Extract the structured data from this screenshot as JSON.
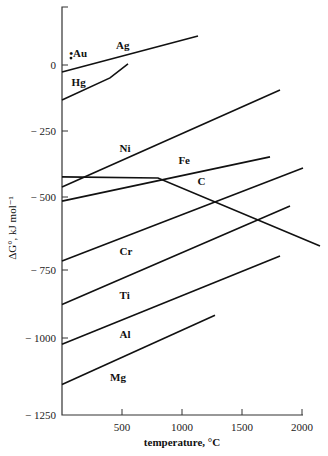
{
  "chart_data": {
    "type": "line",
    "title": "",
    "xlabel": "temperature, °C",
    "ylabel": "ΔG°, kJ mol⁻¹",
    "xlim": [
      0,
      2150
    ],
    "ylim": [
      -1250,
      200
    ],
    "grid": false,
    "legend": "inline labels",
    "x_ticks": [
      500,
      1000,
      1500,
      2000
    ],
    "x_tick_labels": [
      "500",
      "1000",
      "1500",
      "2000"
    ],
    "y_ticks": [
      0,
      -250,
      -500,
      -750,
      -1000,
      -1250
    ],
    "y_tick_labels": [
      "0",
      "− 250",
      "− 500",
      "− 750",
      "− 1000",
      "− 1250"
    ],
    "series": [
      {
        "name": "Ag",
        "points": [
          [
            0,
            -27
          ],
          [
            1133,
            110
          ]
        ]
      },
      {
        "name": "Hg",
        "points": [
          [
            0,
            -133
          ],
          [
            400,
            -49
          ],
          [
            550,
            4
          ]
        ]
      },
      {
        "name": "Ni",
        "points": [
          [
            0,
            -462
          ],
          [
            1817,
            -95
          ]
        ]
      },
      {
        "name": "Fe",
        "points": [
          [
            0,
            -514
          ],
          [
            1733,
            -348
          ]
        ]
      },
      {
        "name": "C",
        "points": [
          [
            0,
            -424
          ],
          [
            800,
            -428
          ],
          [
            2150,
            -668
          ]
        ]
      },
      {
        "name": "Cr",
        "points": [
          [
            0,
            -719
          ],
          [
            2008,
            -390
          ]
        ]
      },
      {
        "name": "Ti",
        "points": [
          [
            0,
            -877
          ],
          [
            1900,
            -531
          ]
        ]
      },
      {
        "name": "Al",
        "points": [
          [
            0,
            -1020
          ],
          [
            1817,
            -702
          ]
        ]
      },
      {
        "name": "Mg",
        "points": [
          [
            0,
            -1151
          ],
          [
            1275,
            -916
          ]
        ]
      }
    ],
    "annotations": [
      {
        "name": "Au",
        "type": "point",
        "x": 75,
        "y": 26
      }
    ],
    "labels": [
      {
        "text": "Ag",
        "x": 450,
        "y": 60
      },
      {
        "text": "•Au",
        "x": 60,
        "y": 30
      },
      {
        "text": "Hg",
        "x": 80,
        "y": -80
      },
      {
        "text": "Ni",
        "x": 480,
        "y": -330
      },
      {
        "text": "Fe",
        "x": 970,
        "y": -375
      },
      {
        "text": "C",
        "x": 1130,
        "y": -455
      },
      {
        "text": "Cr",
        "x": 480,
        "y": -700
      },
      {
        "text": "Ti",
        "x": 480,
        "y": -855
      },
      {
        "text": "Al",
        "x": 480,
        "y": -1000
      },
      {
        "text": "Mg",
        "x": 400,
        "y": -1140
      }
    ]
  }
}
